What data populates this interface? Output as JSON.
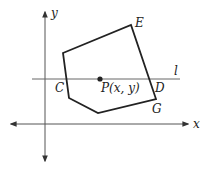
{
  "diagram": {
    "type": "coordinate-geometry",
    "axes": {
      "x_label": "x",
      "y_label": "y"
    },
    "line": {
      "label": "l"
    },
    "point": {
      "label": "P(x, y)"
    },
    "vertices": {
      "C": "C",
      "D": "D",
      "E": "E",
      "G": "G"
    },
    "colors": {
      "stroke": "#222222",
      "axis": "#444444",
      "background": "#ffffff"
    }
  }
}
